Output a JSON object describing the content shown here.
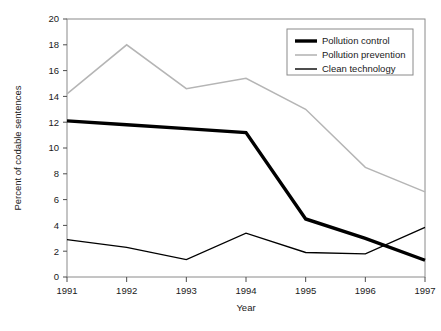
{
  "chart_data": {
    "type": "line",
    "title": "",
    "xlabel": "Year",
    "ylabel": "Percent of codable sentences",
    "x": [
      1991,
      1992,
      1993,
      1994,
      1995,
      1996,
      1997
    ],
    "categories": [
      "1991",
      "1992",
      "1993",
      "1994",
      "1995",
      "1996",
      "1997"
    ],
    "xlim": [
      1991,
      1997
    ],
    "ylim": [
      0,
      20
    ],
    "ytick_labels": [
      "0",
      "2",
      "4",
      "6",
      "8",
      "10",
      "12",
      "14",
      "16",
      "18",
      "20"
    ],
    "ytick_values": [
      0,
      2,
      4,
      6,
      8,
      10,
      12,
      14,
      16,
      18,
      20
    ],
    "grid": false,
    "legend_position": "top-right",
    "series": [
      {
        "name": "Pollution control",
        "values": [
          12.1,
          11.8,
          11.5,
          11.2,
          4.5,
          3.0,
          1.3
        ],
        "color": "#000000",
        "width": 3.4
      },
      {
        "name": "Pollution prevention",
        "values": [
          14.2,
          18.0,
          14.6,
          15.4,
          13.0,
          8.5,
          6.6
        ],
        "color": "#b5b5b5",
        "width": 1.5
      },
      {
        "name": "Clean technology",
        "values": [
          2.9,
          2.3,
          1.35,
          3.4,
          1.9,
          1.8,
          3.85
        ],
        "color": "#000000",
        "width": 1.3
      }
    ]
  },
  "axes": {
    "frame_color": "#808080",
    "tick_color": "#4d4d4d"
  },
  "legend": {
    "border_color": "#808080",
    "background": "#ffffff",
    "items": [
      {
        "label": "Pollution control",
        "color": "#000000",
        "width": 3.4
      },
      {
        "label": "Pollution prevention",
        "color": "#b5b5b5",
        "width": 1.6
      },
      {
        "label": "Clean technology",
        "color": "#000000",
        "width": 1.4
      }
    ]
  }
}
